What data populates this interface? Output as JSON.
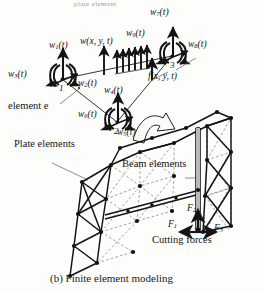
{
  "figure": {
    "caption": "(b) Finite element modeling",
    "top_cropped_text": "plate element",
    "element_label": "element e",
    "distributed_load_label": "w(x, y, t)",
    "point_force_label": "f(x, y, t)",
    "plate_elements_label": "Plate elements",
    "beam_elements_label": "Beam elements",
    "cutting_forces_label": "Cutting forces",
    "ink_color": "#141414",
    "background_color": "#fdfdfc",
    "dashed_color": "#6f6f6f"
  },
  "nodes": [
    {
      "id": "node-1",
      "number": "1",
      "x": 62,
      "y": 79
    },
    {
      "id": "node-2",
      "number": "2",
      "x": 117,
      "y": 122
    },
    {
      "id": "node-3",
      "number": "3",
      "x": 172,
      "y": 56
    }
  ],
  "dof_labels": [
    {
      "id": "w1",
      "symbol": "w",
      "subscript": "1",
      "suffix": "(t)",
      "text": "w1(t)",
      "node": "1",
      "type": "translation"
    },
    {
      "id": "w2",
      "symbol": "w",
      "subscript": "2",
      "suffix": "(t)",
      "text": "w2(t)",
      "node": "1",
      "type": "rotation"
    },
    {
      "id": "w3",
      "symbol": "w",
      "subscript": "3",
      "suffix": "(t)",
      "text": "w3(t)",
      "node": "1",
      "type": "rotation"
    },
    {
      "id": "w4",
      "symbol": "w",
      "subscript": "4",
      "suffix": "(t)",
      "text": "w4(t)",
      "node": "2",
      "type": "translation"
    },
    {
      "id": "w5",
      "symbol": "w",
      "subscript": "5",
      "suffix": "(t)",
      "text": "w5(t)",
      "node": "2",
      "type": "rotation"
    },
    {
      "id": "w6",
      "symbol": "w",
      "subscript": "6",
      "suffix": "(t)",
      "text": "w6(t)",
      "node": "2",
      "type": "rotation"
    },
    {
      "id": "w7",
      "symbol": "w",
      "subscript": "7",
      "suffix": "(t)",
      "text": "w7(t)",
      "node": "3",
      "type": "translation"
    },
    {
      "id": "w8",
      "symbol": "w",
      "subscript": "8",
      "suffix": "(t)",
      "text": "w8(t)",
      "node": "3",
      "type": "rotation"
    },
    {
      "id": "w9",
      "symbol": "w",
      "subscript": "9",
      "suffix": "(t)",
      "text": "w9(t)",
      "node": "3",
      "type": "rotation"
    }
  ],
  "forces": [
    {
      "id": "F1",
      "symbol": "F",
      "subscript": "1",
      "text": "F1",
      "direction": "left"
    },
    {
      "id": "F2",
      "symbol": "F",
      "subscript": "2",
      "text": "F2",
      "direction": "up"
    },
    {
      "id": "F3",
      "symbol": "F",
      "subscript": "3",
      "text": "F3",
      "direction": "right"
    }
  ]
}
